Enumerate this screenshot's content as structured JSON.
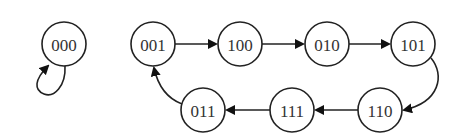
{
  "diagram": {
    "type": "state-transition",
    "nodes": [
      {
        "id": "000",
        "label": "000",
        "x": 64,
        "y": 44
      },
      {
        "id": "001",
        "label": "001",
        "x": 153,
        "y": 44
      },
      {
        "id": "100",
        "label": "100",
        "x": 240,
        "y": 44
      },
      {
        "id": "010",
        "label": "010",
        "x": 327,
        "y": 44
      },
      {
        "id": "101",
        "label": "101",
        "x": 413,
        "y": 44
      },
      {
        "id": "110",
        "label": "110",
        "x": 380,
        "y": 110
      },
      {
        "id": "111",
        "label": "111",
        "x": 292,
        "y": 110
      },
      {
        "id": "011",
        "label": "011",
        "x": 203,
        "y": 110
      }
    ],
    "edges": [
      {
        "from": "000",
        "to": "000",
        "kind": "self-loop"
      },
      {
        "from": "001",
        "to": "100"
      },
      {
        "from": "100",
        "to": "010"
      },
      {
        "from": "010",
        "to": "101"
      },
      {
        "from": "101",
        "to": "110"
      },
      {
        "from": "110",
        "to": "111"
      },
      {
        "from": "111",
        "to": "011"
      },
      {
        "from": "011",
        "to": "001"
      }
    ]
  }
}
